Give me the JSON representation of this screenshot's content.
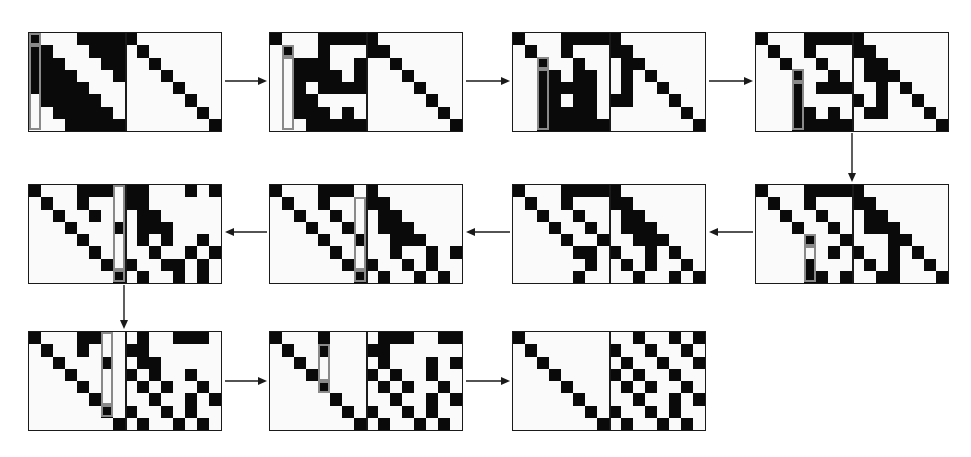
{
  "figure": {
    "rows": 8,
    "cols": 16,
    "colors": {
      "one": "#0a0a0a",
      "zero": "#fafafa",
      "highlight": "#8a8a8a",
      "border": "#1a1a1a"
    }
  },
  "panels": [
    {
      "id": 1,
      "x": 28,
      "y": 32,
      "highlight": {
        "col": 0,
        "row_start": 1,
        "row_end": 7,
        "pivot_row": 0
      },
      "grid": [
        "1000111110000000",
        "1100011101000000",
        "1110001100100000",
        "1111000100010000",
        "1111100000001000",
        "0111110000000100",
        "0011111000000010",
        "0001111100000001"
      ]
    },
    {
      "id": 2,
      "x": 269,
      "y": 32,
      "highlight": {
        "col": 1,
        "row_start": 2,
        "row_end": 7,
        "pivot_row": 1
      },
      "grid": [
        "1000111110000000",
        "0100100011000000",
        "0011100100100000",
        "0011110100010000",
        "0010111100001000",
        "0011000000000100",
        "0011101000000010",
        "0001111100000001"
      ]
    },
    {
      "id": 3,
      "x": 512,
      "y": 32,
      "highlight": {
        "col": 2,
        "row_start": 3,
        "row_end": 7,
        "pivot_row": 2
      },
      "grid": [
        "1000111110000000",
        "0100100011000000",
        "0010010001100000",
        "0011011001010000",
        "0011111001001000",
        "0011011011000100",
        "0011111000000010",
        "0011111100000001"
      ]
    },
    {
      "id": 4,
      "x": 755,
      "y": 32,
      "highlight": {
        "col": 3,
        "row_start": 4,
        "row_end": 7,
        "pivot_row": 3
      },
      "grid": [
        "1000111110000000",
        "0100100011000000",
        "0010010001100000",
        "0001001001110000",
        "0001011100101000",
        "0001000010100100",
        "0001101001100010",
        "0001111100000001"
      ]
    },
    {
      "id": 5,
      "x": 755,
      "y": 184,
      "highlight": {
        "col": 4,
        "row_start": 5,
        "row_end": 7,
        "pivot_row": 4
      },
      "grid": [
        "1000111110000000",
        "0100100011000000",
        "0010010001100000",
        "0001001001110000",
        "0000100100011000",
        "0000001010010100",
        "0000100001010010",
        "0000110100110001"
      ]
    },
    {
      "id": 6,
      "x": 512,
      "y": 184,
      "highlight": null,
      "grid": [
        "1000111110000000",
        "0100100011000000",
        "0010010001100000",
        "0001001001110000",
        "0000100100111000",
        "0000011010010100",
        "0000001001010010",
        "0000010000100101"
      ]
    },
    {
      "id": 7,
      "x": 269,
      "y": 184,
      "highlight": {
        "col": 7,
        "row_start": 1,
        "row_end": 6,
        "pivot_row": 7
      },
      "grid": [
        "1000111010000000",
        "0100100011000000",
        "0010010001100000",
        "0001001001110000",
        "0000100100111000",
        "0000010000100101",
        "0000001010010100",
        "0000000101001010"
      ]
    },
    {
      "id": 8,
      "x": 28,
      "y": 184,
      "highlight": {
        "col": 7,
        "row_start": 0,
        "row_end": 6,
        "pivot_row": 7
      },
      "grid": [
        "1000111011000101",
        "0100100011000000",
        "0010010001100000",
        "0001000101110000",
        "0000100001010010",
        "0000010000100101",
        "0000001010011010",
        "0000000101001010"
      ]
    },
    {
      "id": 9,
      "x": 28,
      "y": 331,
      "highlight": {
        "col": 6,
        "row_start": 0,
        "row_end": 5,
        "pivot_row": 6
      },
      "grid": [
        "1000110001001110",
        "0100100011000000",
        "0010001001100000",
        "0001000010100100",
        "0000100001010010",
        "0000010000100101",
        "0000001010010100",
        "0000000101001010"
      ]
    },
    {
      "id": 10,
      "x": 269,
      "y": 331,
      "highlight": {
        "col": 4,
        "row_start": 1,
        "row_end": 3,
        "pivot_row": 4
      },
      "grid": [
        "1000100001110011",
        "0100100011000000",
        "0010000001000101",
        "0001000010100100",
        "0000100001010010",
        "0000010000100101",
        "0000001010010100",
        "0000000101001010"
      ]
    },
    {
      "id": 11,
      "x": 512,
      "y": 331,
      "highlight": null,
      "grid": [
        "1000000000100101",
        "0100000010010010",
        "0010000001001001",
        "0001000010100100",
        "0000100001010010",
        "0000010000100101",
        "0000001010010100",
        "0000000101001010"
      ]
    }
  ],
  "arrows": [
    {
      "from": 1,
      "to": 2,
      "dir": "right",
      "x1": 225,
      "y1": 81,
      "x2": 267,
      "y2": 81
    },
    {
      "from": 2,
      "to": 3,
      "dir": "right",
      "x1": 466,
      "y1": 81,
      "x2": 510,
      "y2": 81
    },
    {
      "from": 3,
      "to": 4,
      "dir": "right",
      "x1": 709,
      "y1": 81,
      "x2": 753,
      "y2": 81
    },
    {
      "from": 4,
      "to": 5,
      "dir": "down",
      "x1": 852,
      "y1": 133,
      "x2": 852,
      "y2": 182
    },
    {
      "from": 5,
      "to": 6,
      "dir": "left",
      "x1": 753,
      "y1": 232,
      "x2": 709,
      "y2": 232
    },
    {
      "from": 6,
      "to": 7,
      "dir": "left",
      "x1": 510,
      "y1": 232,
      "x2": 466,
      "y2": 232
    },
    {
      "from": 7,
      "to": 8,
      "dir": "left",
      "x1": 267,
      "y1": 232,
      "x2": 225,
      "y2": 232
    },
    {
      "from": 8,
      "to": 9,
      "dir": "down",
      "x1": 124,
      "y1": 285,
      "x2": 124,
      "y2": 329
    },
    {
      "from": 9,
      "to": 10,
      "dir": "right",
      "x1": 225,
      "y1": 381,
      "x2": 267,
      "y2": 381
    },
    {
      "from": 10,
      "to": 11,
      "dir": "right",
      "x1": 466,
      "y1": 381,
      "x2": 510,
      "y2": 381
    }
  ]
}
